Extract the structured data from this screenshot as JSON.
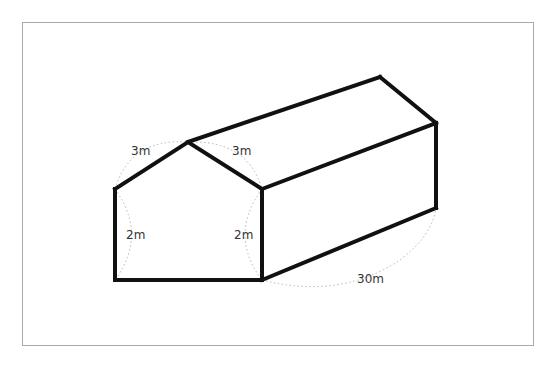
{
  "diagram": {
    "labels": {
      "roof_slope_left": "3m",
      "roof_slope_right": "3m",
      "wall_height_left": "2m",
      "wall_height_right": "2m",
      "length": "30m"
    },
    "colors": {
      "edge": "#111111",
      "dimension_arc": "#b4b4b4",
      "label": "#333333",
      "frame": "#a9a9a9"
    }
  }
}
